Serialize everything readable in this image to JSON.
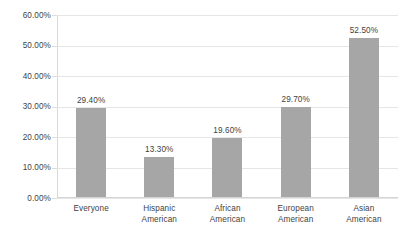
{
  "chart_data": {
    "type": "bar",
    "title": "",
    "subtitle": "",
    "xlabel": "",
    "ylabel": "",
    "categories": [
      "Everyone",
      "Hispanic American",
      "African American",
      "European American",
      "Asian American"
    ],
    "category_lines": [
      [
        "Everyone"
      ],
      [
        "Hispanic",
        "American"
      ],
      [
        "African",
        "American"
      ],
      [
        "European",
        "American"
      ],
      [
        "Asian",
        "American"
      ]
    ],
    "values": [
      29.4,
      13.3,
      19.6,
      29.7,
      52.5
    ],
    "data_labels": [
      "29.40%",
      "13.30%",
      "19.60%",
      "29.70%",
      "52.50%"
    ],
    "ylim": [
      0,
      60
    ],
    "ytick_values": [
      0,
      10,
      20,
      30,
      40,
      50,
      60
    ],
    "ytick_labels": [
      "0.00%",
      "10.00%",
      "20.00%",
      "30.00%",
      "40.00%",
      "50.00%",
      "60.00%"
    ],
    "grid": true,
    "legend": "none",
    "bar_color": "#a6a6a6",
    "gridline_color": "#e6e6e6",
    "axis_color": "#d9d9d9",
    "text_color": "#3f3f3f",
    "background_color": "#ffffff"
  }
}
